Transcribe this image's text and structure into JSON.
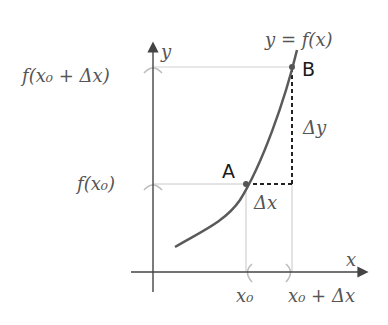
{
  "diagram": {
    "type": "derivative-secant-illustration",
    "colors": {
      "curve": "#5a5a5a",
      "axes": "#444444",
      "guide_lines": "#c8c8c8",
      "dashed": "#222222",
      "text_math": "#555555",
      "text_points": "#1a1a1a"
    },
    "labels": {
      "curve": "y = f(x)",
      "y_axis": "y",
      "x_axis": "x",
      "point_a": "A",
      "point_b": "B",
      "delta_x": "Δx",
      "delta_y": "Δy",
      "y_tick_top": "f(x₀ + Δx)",
      "y_tick_bottom": "f(x₀)",
      "x_tick_left": "x₀",
      "x_tick_right": "x₀ + Δx"
    }
  }
}
